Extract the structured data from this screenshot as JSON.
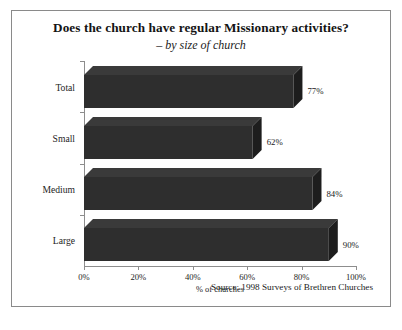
{
  "chart_data": {
    "type": "bar",
    "orientation": "horizontal",
    "title": "Does the church have regular Missionary activities?",
    "subtitle": "– by size of church",
    "categories": [
      "Total",
      "Small",
      "Medium",
      "Large"
    ],
    "values": [
      77,
      62,
      84,
      90
    ],
    "value_labels": [
      "77%",
      "62%",
      "84%",
      "90%"
    ],
    "xlabel": "% of churches",
    "ylabel": "",
    "xlim": [
      0,
      100
    ],
    "xticks": [
      0,
      20,
      40,
      60,
      80,
      100
    ],
    "xtick_labels": [
      "0%",
      "20%",
      "40%",
      "60%",
      "80%",
      "100%"
    ],
    "grid": false,
    "legend": false,
    "bar_color": "#2e2e2e",
    "bar_top_color": "#3a3a3a",
    "bar_side_color": "#1d1d1d",
    "source": "Source: 1998 Surveys of Brethren Churches"
  }
}
